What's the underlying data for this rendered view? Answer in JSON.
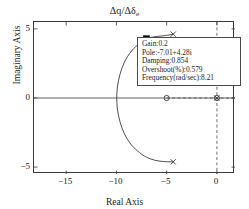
{
  "chart_data": {
    "type": "scatter",
    "title": "Δq/Δδe",
    "title_main": "Δq/Δδ",
    "title_sub": "e",
    "xlabel": "Real Axis",
    "ylabel": "Imaginary Axis",
    "xlim": [
      -18.2,
      1.8
    ],
    "ylim": [
      -5.5,
      5.5
    ],
    "xticks": [
      -15,
      -10,
      -5,
      0
    ],
    "xtick_labels": [
      "−15",
      "−10",
      "−5",
      "0"
    ],
    "yticks": [
      5,
      0,
      -5
    ],
    "ytick_labels": [
      "5",
      "0",
      "−5"
    ],
    "grid": false,
    "legend": null,
    "series": [
      {
        "name": "root-locus-upper-branch",
        "kind": "line",
        "color": "#3a3a3a",
        "points": [
          [
            -4.35,
            4.62
          ],
          [
            -5.1,
            4.52
          ],
          [
            -5.9,
            4.46
          ],
          [
            -6.6,
            4.38
          ],
          [
            -7.01,
            4.28
          ],
          [
            -7.7,
            3.95
          ],
          [
            -8.5,
            3.4
          ],
          [
            -9.2,
            2.6
          ],
          [
            -9.65,
            1.7
          ],
          [
            -9.9,
            0.8
          ],
          [
            -9.97,
            0.0
          ]
        ]
      },
      {
        "name": "root-locus-lower-branch",
        "kind": "line",
        "color": "#3a3a3a",
        "points": [
          [
            -9.97,
            0.0
          ],
          [
            -9.9,
            -0.8
          ],
          [
            -9.65,
            -1.7
          ],
          [
            -9.2,
            -2.6
          ],
          [
            -8.5,
            -3.4
          ],
          [
            -7.7,
            -3.95
          ],
          [
            -7.01,
            -4.28
          ],
          [
            -6.2,
            -4.5
          ],
          [
            -5.3,
            -4.6
          ],
          [
            -4.35,
            -4.62
          ]
        ]
      },
      {
        "name": "open-loop-poles",
        "kind": "marker",
        "marker": "x",
        "color": "#3a3a3a",
        "points": [
          [
            -4.35,
            4.62
          ],
          [
            -4.35,
            -4.62
          ],
          [
            0.0,
            0.0
          ]
        ]
      },
      {
        "name": "open-loop-zeros",
        "kind": "marker",
        "marker": "o",
        "color": "#3a3a3a",
        "points": [
          [
            -5.0,
            0.0
          ],
          [
            0.0,
            0.0
          ]
        ]
      },
      {
        "name": "selected-point",
        "kind": "marker",
        "marker": "square-filled",
        "color": "#000000",
        "points": [
          [
            -7.01,
            4.28
          ]
        ]
      },
      {
        "name": "real-axis-locus-dashed",
        "kind": "dashed-line",
        "color": "#4a4a4a",
        "points": [
          [
            -5.0,
            0.0
          ],
          [
            1.8,
            0.0
          ]
        ]
      },
      {
        "name": "imaginary-axis-dashed",
        "kind": "dashed-line",
        "color": "#4a4a4a",
        "points": [
          [
            0.0,
            5.5
          ],
          [
            0.0,
            -5.5
          ]
        ]
      }
    ]
  },
  "datatip": {
    "lines": [
      "Gain:0.2",
      "Pole:-7.01+4.28i",
      "Damping:0.854",
      "Overshoot(%):0.579",
      "Frequency(rad/sec):8.21"
    ],
    "gain": "Gain:0.2",
    "pole": "Pole:-7.01+4.28i",
    "damping": "Damping:0.854",
    "overshoot": "Overshoot(%):0.579",
    "frequency": "Frequency(rad/sec):8.21"
  }
}
